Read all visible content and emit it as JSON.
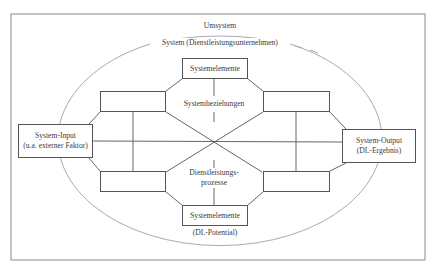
{
  "diagram": {
    "outer_label": "Umsystem",
    "system_label": "System (Dienstleistungsunternehmen)",
    "top_element": {
      "label": "Systemelemente"
    },
    "bottom_element": {
      "label": "Systemelemente",
      "sublabel": "(DL-Potential)"
    },
    "relations_label": "Systembeziehungen",
    "processes_label_line1": "Dienstleistungs-",
    "processes_label_line2": "prozesse",
    "input": {
      "line1": "System-Input",
      "line2": "(u.a. externer Faktor)"
    },
    "output": {
      "line1": "System-Output",
      "line2": "(DL-Ergebnis)"
    },
    "colors": {
      "line": "#555555",
      "ellipse": "#9a9a9a",
      "frame": "#8a8a8a",
      "text": "#3a3a3a"
    }
  }
}
